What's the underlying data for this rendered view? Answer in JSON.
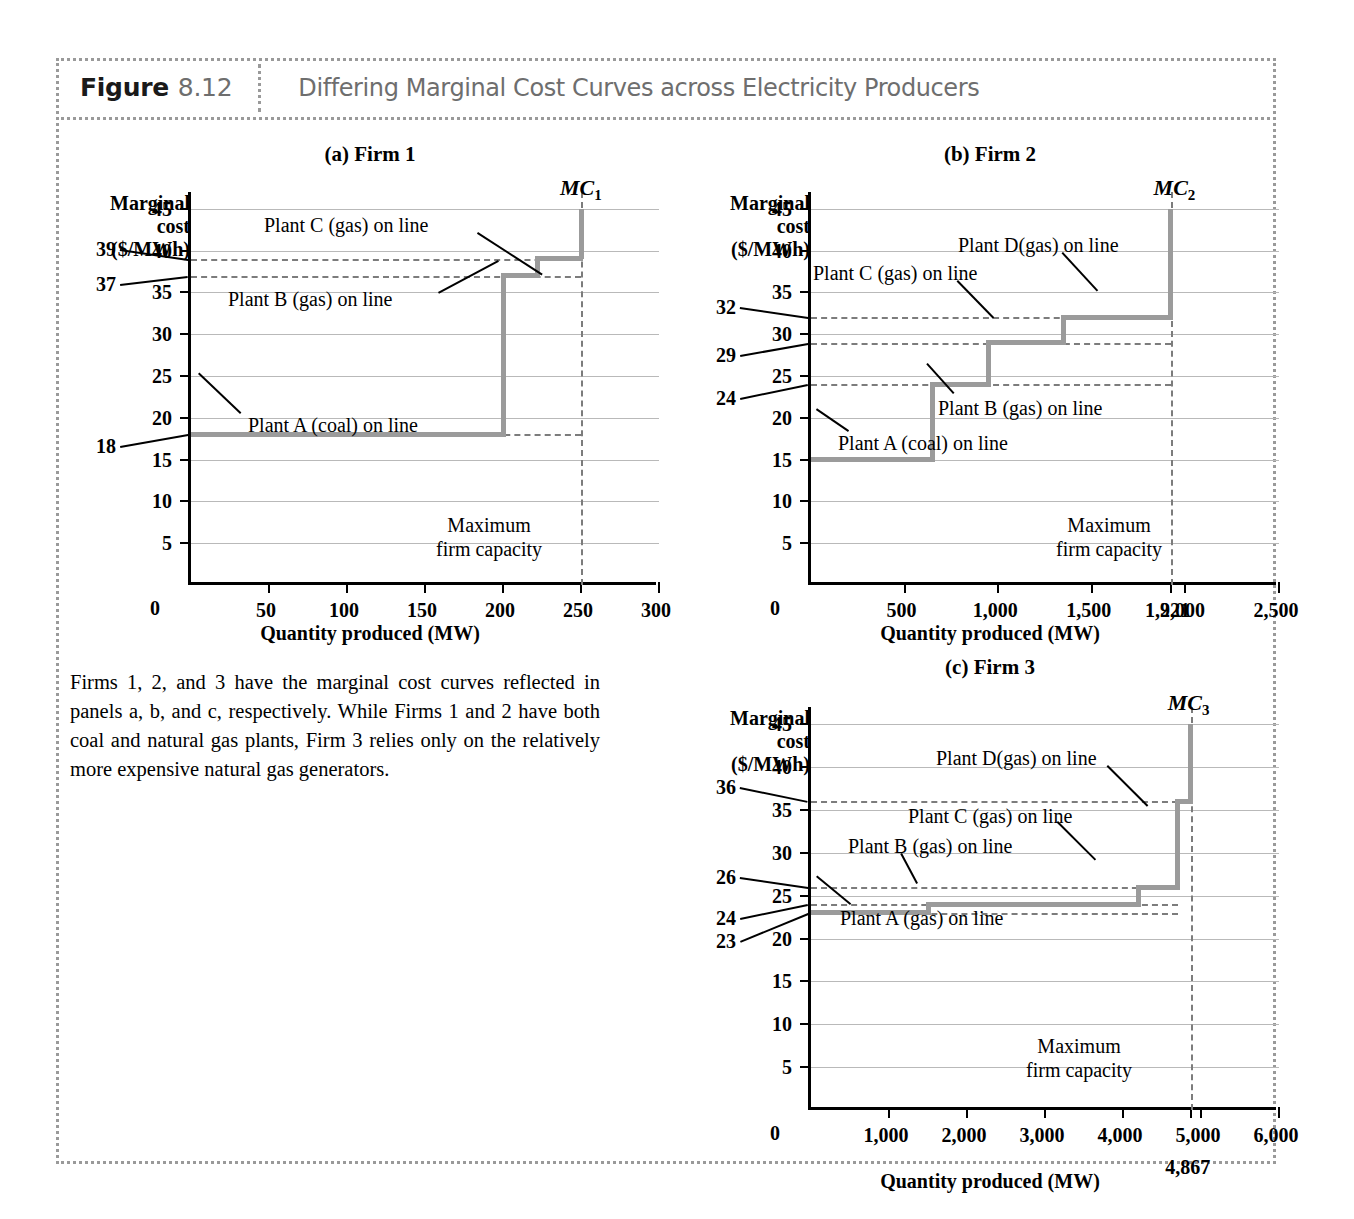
{
  "figure": {
    "label": "Figure",
    "number": "8.12",
    "title": "Differing Marginal Cost Curves across Electricity Producers"
  },
  "caption": "Firms 1, 2, and 3 have the marginal cost curves reflected in panels a, b, and c, respectively. While Firms 1 and 2 have both coal and natural gas plants, Firm 3 relies only on the relatively more expensive natural gas generators.",
  "common": {
    "y_axis_title_line1": "Marginal",
    "y_axis_title_line2": "cost",
    "y_axis_title_line3": "($/MWh)",
    "x_axis_title": "Quantity produced (MW)",
    "max_capacity_line1": "Maximum",
    "max_capacity_line2": "firm capacity",
    "zero_label": "0",
    "curve_color": "#9b9b9b",
    "grid_color": "#b9b9b9",
    "dash_color": "#7c7c7c"
  },
  "chart_data": [
    {
      "type": "line",
      "id": "panel-a",
      "title": "(a) Firm 1",
      "curve_label": "MC",
      "curve_subscript": "1",
      "xlabel": "Quantity produced (MW)",
      "ylabel": "Marginal cost ($/MWh)",
      "xlim": [
        0,
        300
      ],
      "ylim": [
        0,
        47
      ],
      "xticks": [
        50,
        100,
        150,
        200,
        250,
        300
      ],
      "xtick_labels": [
        "50",
        "100",
        "150",
        "200",
        "250",
        "300"
      ],
      "yticks": [
        5,
        10,
        15,
        20,
        25,
        30,
        35,
        40,
        45
      ],
      "ytick_labels": [
        "5",
        "10",
        "15",
        "20",
        "25",
        "30",
        "35",
        "40",
        "45"
      ],
      "extra_y_labels": [
        {
          "value": 39,
          "label": "39"
        },
        {
          "value": 37,
          "label": "37"
        },
        {
          "value": 18,
          "label": "18"
        }
      ],
      "grid": true,
      "max_firm_capacity": 250,
      "max_firm_capacity_label": "",
      "steps": [
        {
          "x_start": 0,
          "x_end": 200,
          "y": 18,
          "plant": "Plant A (coal) on line"
        },
        {
          "x_start": 200,
          "x_end": 222,
          "y": 37,
          "plant": "Plant B (gas) on line"
        },
        {
          "x_start": 222,
          "x_end": 250,
          "y": 39,
          "plant": "Plant C (gas) on line"
        }
      ],
      "annotations": [
        {
          "text": "Plant C (gas) on line"
        },
        {
          "text": "Plant B (gas) on line"
        },
        {
          "text": "Plant A (coal) on line"
        }
      ]
    },
    {
      "type": "line",
      "id": "panel-b",
      "title": "(b) Firm 2",
      "curve_label": "MC",
      "curve_subscript": "2",
      "xlabel": "Quantity produced (MW)",
      "ylabel": "Marginal cost ($/MWh)",
      "xlim": [
        0,
        2500
      ],
      "ylim": [
        0,
        47
      ],
      "xticks": [
        500,
        1000,
        1500,
        1921,
        2000,
        2500
      ],
      "xtick_labels": [
        "500",
        "1,000",
        "1,500",
        "1,921",
        "2,000",
        "2,500"
      ],
      "yticks": [
        5,
        10,
        15,
        20,
        25,
        30,
        35,
        40,
        45
      ],
      "ytick_labels": [
        "5",
        "10",
        "15",
        "20",
        "25",
        "30",
        "35",
        "40",
        "45"
      ],
      "extra_y_labels": [
        {
          "value": 32,
          "label": "32"
        },
        {
          "value": 29,
          "label": "29"
        },
        {
          "value": 24,
          "label": "24"
        }
      ],
      "grid": true,
      "max_firm_capacity": 1921,
      "max_firm_capacity_label": "1,921",
      "steps": [
        {
          "x_start": 0,
          "x_end": 650,
          "y": 15,
          "plant": "Plant A (coal) on line"
        },
        {
          "x_start": 650,
          "x_end": 950,
          "y": 24,
          "plant": "Plant B (gas) on line"
        },
        {
          "x_start": 950,
          "x_end": 1350,
          "y": 29,
          "plant": "Plant C (gas) on line"
        },
        {
          "x_start": 1350,
          "x_end": 1921,
          "y": 32,
          "plant": "Plant D(gas) on line"
        }
      ],
      "annotations": [
        {
          "text": "Plant D(gas) on line"
        },
        {
          "text": "Plant C (gas) on line"
        },
        {
          "text": "Plant B (gas) on line"
        },
        {
          "text": "Plant A (coal) on line"
        }
      ]
    },
    {
      "type": "line",
      "id": "panel-c",
      "title": "(c) Firm 3",
      "curve_label": "MC",
      "curve_subscript": "3",
      "xlabel": "Quantity produced (MW)",
      "ylabel": "Marginal cost ($/MWh)",
      "xlim": [
        0,
        6000
      ],
      "ylim": [
        0,
        47
      ],
      "xticks": [
        1000,
        2000,
        3000,
        4000,
        4867,
        5000,
        6000
      ],
      "xtick_labels": [
        "1,000",
        "2,000",
        "3,000",
        "4,000",
        "4,867",
        "5,000",
        "6,000"
      ],
      "yticks": [
        5,
        10,
        15,
        20,
        25,
        30,
        35,
        40,
        45
      ],
      "ytick_labels": [
        "5",
        "10",
        "15",
        "20",
        "25",
        "30",
        "35",
        "40",
        "45"
      ],
      "extra_y_labels": [
        {
          "value": 36,
          "label": "36"
        },
        {
          "value": 26,
          "label": "26"
        },
        {
          "value": 24,
          "label": "24"
        },
        {
          "value": 23,
          "label": "23"
        }
      ],
      "grid": true,
      "max_firm_capacity": 4867,
      "max_firm_capacity_label": "4,867",
      "steps": [
        {
          "x_start": 0,
          "x_end": 1500,
          "y": 23,
          "plant": "Plant A (gas) on line"
        },
        {
          "x_start": 1500,
          "x_end": 4200,
          "y": 24,
          "plant": "Plant B (gas) on line"
        },
        {
          "x_start": 4200,
          "x_end": 4700,
          "y": 26,
          "plant": "Plant C (gas) on line"
        },
        {
          "x_start": 4700,
          "x_end": 4867,
          "y": 36,
          "plant": "Plant D(gas) on line"
        }
      ],
      "annotations": [
        {
          "text": "Plant D(gas) on line"
        },
        {
          "text": "Plant C (gas) on line"
        },
        {
          "text": "Plant B (gas) on line"
        },
        {
          "text": "Plant A (gas) on line"
        }
      ]
    }
  ]
}
